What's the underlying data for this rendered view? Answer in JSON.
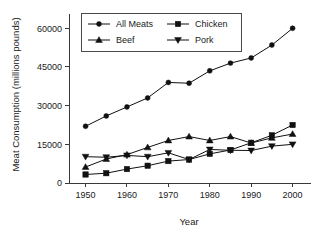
{
  "chart_data": {
    "type": "line",
    "title": "",
    "xlabel": "Year",
    "ylabel": "Meat Consumption (millions pounds)",
    "x": [
      1950,
      1955,
      1960,
      1965,
      1970,
      1975,
      1980,
      1985,
      1990,
      1995,
      2000
    ],
    "xlim": [
      1946,
      2003
    ],
    "ylim": [
      0,
      64000
    ],
    "xticks": [
      1950,
      1960,
      1970,
      1980,
      1990,
      2000
    ],
    "xtick_labels": [
      "1950",
      "1960",
      "1970",
      "1980",
      "1990",
      "2000"
    ],
    "yticks": [
      0,
      15000,
      30000,
      45000,
      60000
    ],
    "ytick_labels": [
      "0",
      "15000",
      "30000",
      "45000",
      "60000"
    ],
    "grid": false,
    "legend_position": "top",
    "series": [
      {
        "name": "All Meats",
        "marker": "circle",
        "values": [
          22000,
          26000,
          29500,
          33000,
          39000,
          38700,
          43500,
          46500,
          48500,
          53500,
          60000
        ]
      },
      {
        "name": "Chicken",
        "marker": "square",
        "values": [
          3300,
          3800,
          5400,
          6700,
          8500,
          9100,
          11300,
          12800,
          15600,
          18500,
          22500
        ]
      },
      {
        "name": "Beef",
        "marker": "triangle-up",
        "values": [
          6200,
          9300,
          11000,
          13800,
          16500,
          18000,
          16500,
          18000,
          15500,
          17500,
          19000
        ]
      },
      {
        "name": "Pork",
        "marker": "triangle-down",
        "values": [
          10200,
          10000,
          10700,
          10200,
          11700,
          9100,
          13000,
          12700,
          12600,
          14300,
          15000
        ]
      }
    ],
    "legend_entries": [
      {
        "label": "All Meats",
        "marker": "circle"
      },
      {
        "label": "Chicken",
        "marker": "square"
      },
      {
        "label": "Beef",
        "marker": "triangle-up"
      },
      {
        "label": "Pork",
        "marker": "triangle-down"
      }
    ],
    "colors": {
      "series": "#111111",
      "axis": "#3a3a3a",
      "text": "#1a1a1a",
      "background": "#ffffff"
    }
  }
}
